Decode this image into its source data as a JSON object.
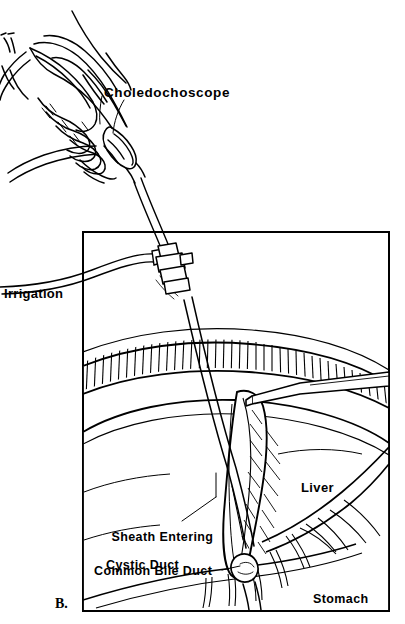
{
  "figure": {
    "panel_label": "B.",
    "background_color": "#ffffff",
    "ink_color": "#000000",
    "labels": {
      "choledochoscope": "Choledochoscope",
      "irrigation": "Irrigation",
      "sheath_entering": "Sheath Entering",
      "cystic_duct": "Cystic Duct",
      "common_bile_duct": "Common Bile Duct",
      "liver": "Liver",
      "stomach": "Stomach"
    }
  }
}
